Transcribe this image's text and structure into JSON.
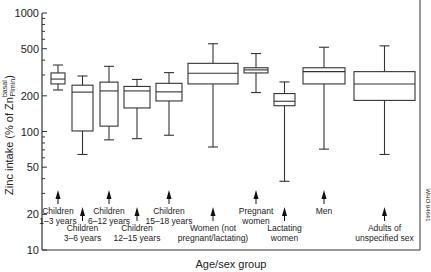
{
  "chart_data": {
    "type": "box",
    "title": "",
    "xlabel": "Age/sex group",
    "ylabel": "Zinc intake (% of Zn",
    "ylabel_sup": "basal",
    "ylabel_sub": "Plmin",
    "ylabel_close": ")",
    "yscale": "log",
    "ylim": [
      10,
      1000
    ],
    "yticks": [
      10,
      20,
      50,
      100,
      200,
      500,
      1000
    ],
    "ytick_labels": [
      "10",
      "20",
      "50",
      "100",
      "200",
      "500",
      "1000"
    ],
    "grid": false,
    "legend": null,
    "watermark": "WHO 94641",
    "categories": [
      "Children 1–3 years",
      "Children 3–6 years",
      "Children 6–12 years",
      "Children 12–15 years",
      "Children 15–18 years",
      "Women (not pregnant/lactating)",
      "Pregnant women",
      "Lactating women",
      "Men",
      "Adults of unspecified sex"
    ],
    "boxes": [
      {
        "label": [
          "Children",
          "1–3 years"
        ],
        "whisker_low": 224,
        "q1": 252,
        "median": 277,
        "q3": 312,
        "whisker_high": 364,
        "x0": 51,
        "x1": 65,
        "label_row": 0
      },
      {
        "label": [
          "Children",
          "3–6 years"
        ],
        "whisker_low": 64,
        "q1": 101,
        "median": 215,
        "q3": 246,
        "whisker_high": 294,
        "x0": 72,
        "x1": 93,
        "label_row": 1
      },
      {
        "label": [
          "Children",
          "6–12 years"
        ],
        "whisker_low": 85,
        "q1": 111,
        "median": 220,
        "q3": 261,
        "whisker_high": 355,
        "x0": 100,
        "x1": 118,
        "label_row": 0
      },
      {
        "label": [
          "Children",
          "12–15 years"
        ],
        "whisker_low": 87,
        "q1": 158,
        "median": 220,
        "q3": 240,
        "whisker_high": 275,
        "x0": 124,
        "x1": 150,
        "label_row": 1
      },
      {
        "label": [
          "Children",
          "15–18 years"
        ],
        "whisker_low": 93,
        "q1": 181,
        "median": 216,
        "q3": 255,
        "whisker_high": 314,
        "x0": 156,
        "x1": 182,
        "label_row": 0
      },
      {
        "label": [
          "Women (not",
          "pregnant/lactating)"
        ],
        "whisker_low": 74,
        "q1": 252,
        "median": 310,
        "q3": 376,
        "whisker_high": 550,
        "x0": 188,
        "x1": 238,
        "label_row": 1
      },
      {
        "label": [
          "Pregnant",
          "women"
        ],
        "whisker_low": 213,
        "q1": 312,
        "median": 331,
        "q3": 345,
        "whisker_high": 455,
        "x0": 244,
        "x1": 268,
        "label_row": 0
      },
      {
        "label": [
          "Lactating",
          "women"
        ],
        "whisker_low": 38,
        "q1": 165,
        "median": 180,
        "q3": 209,
        "whisker_high": 262,
        "x0": 274,
        "x1": 295,
        "label_row": 1
      },
      {
        "label": [
          "Men"
        ],
        "whisker_low": 71,
        "q1": 252,
        "median": 320,
        "q3": 345,
        "whisker_high": 514,
        "x0": 303,
        "x1": 345,
        "label_row": 0
      },
      {
        "label": [
          "Adults of",
          "unspecified sex"
        ],
        "whisker_low": 64,
        "q1": 183,
        "median": 252,
        "q3": 320,
        "whisker_high": 528,
        "x0": 354,
        "x1": 415,
        "label_row": 1
      }
    ]
  },
  "layout": {
    "plot_left": 42,
    "plot_right": 420,
    "plot_top": 13,
    "plot_bottom": 250,
    "px_per_decade": 118.5
  }
}
